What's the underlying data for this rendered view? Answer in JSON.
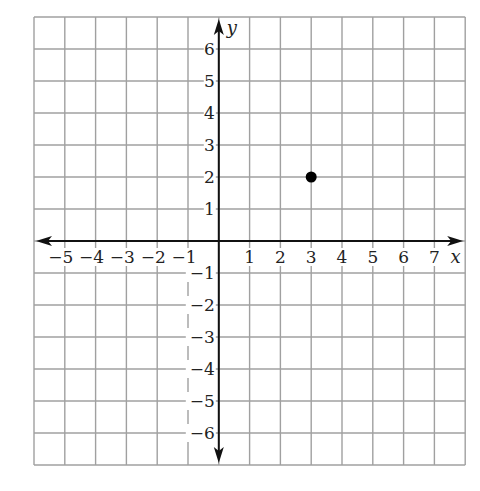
{
  "chart_data": {
    "type": "scatter",
    "title": "",
    "xlabel": "x",
    "ylabel": "y",
    "xlim": [
      -6,
      8
    ],
    "ylim": [
      -7,
      7
    ],
    "grid": true,
    "x_ticks": [
      "−5",
      "−4",
      "−3",
      "−2",
      "−1",
      "1",
      "2",
      "3",
      "4",
      "5",
      "6",
      "7"
    ],
    "y_ticks": [
      "6",
      "5",
      "4",
      "3",
      "2",
      "1",
      "−1",
      "−2",
      "−3",
      "−4",
      "−5",
      "−6"
    ],
    "points": [
      {
        "x": 3,
        "y": 2
      }
    ],
    "series": [
      {
        "name": "point",
        "x": [
          3
        ],
        "y": [
          2
        ]
      }
    ]
  },
  "colors": {
    "grid": "#a0a0a0",
    "axis": "#111111",
    "point": "#000000"
  },
  "layout": {
    "left": 34,
    "top": 17,
    "unitX": 30.8,
    "unitY": 32,
    "xmin": -6,
    "xmax": 8,
    "ymin": -7,
    "ymax": 7
  }
}
